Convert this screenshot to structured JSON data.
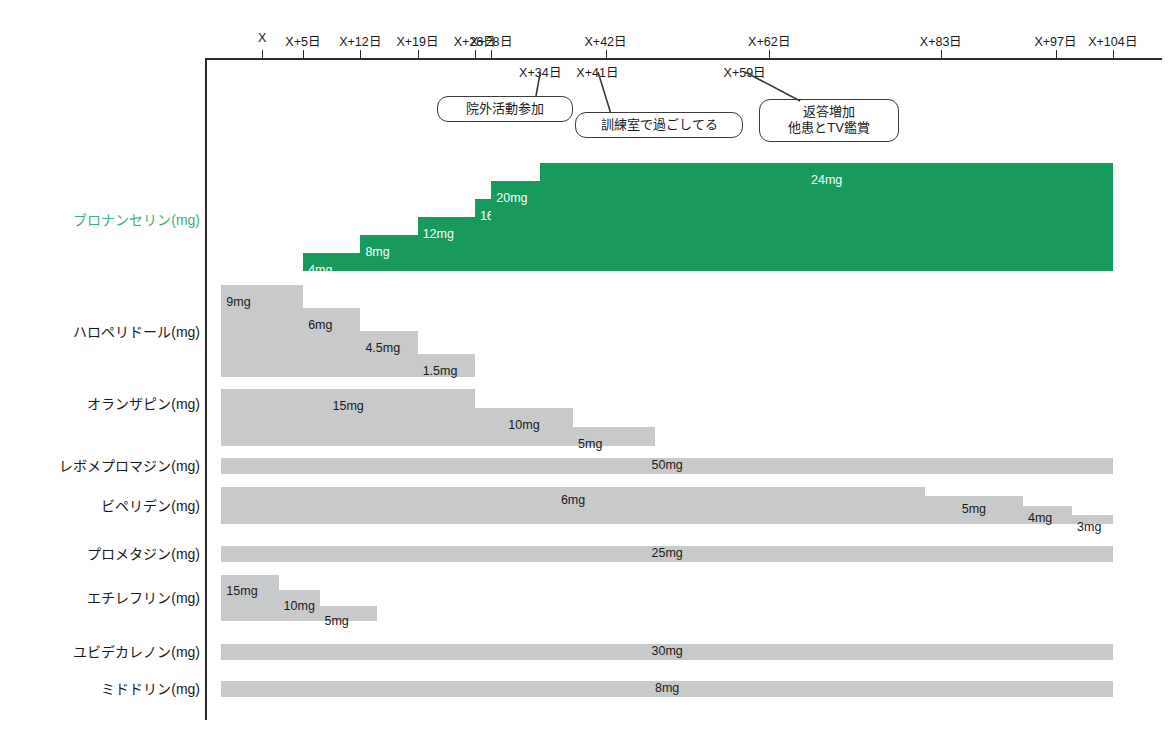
{
  "chart_data": {
    "type": "bar",
    "subtype": "horizontal-timeline-dose-titration",
    "title": "",
    "xlabel": "",
    "ylabel": "",
    "grid": false,
    "legend": "none",
    "axis": {
      "line_color": "#2b2b2b",
      "tick_labels": [
        "X",
        "X+5日",
        "X+12日",
        "X+19日",
        "X+26日",
        "X+28日",
        "X+42日",
        "X+62日",
        "X+83日",
        "X+97日",
        "X+104日"
      ],
      "tick_days": [
        0,
        5,
        12,
        19,
        26,
        28,
        42,
        62,
        83,
        97,
        104
      ],
      "sub_tick_labels": [
        "X+34日",
        "X+41日",
        "X+59日"
      ],
      "sub_tick_days": [
        34,
        41,
        59
      ],
      "range_days": [
        -7,
        110
      ]
    },
    "annotations": [
      {
        "id": "outside-activity",
        "text": "院外活動参加",
        "anchor_label": "X+34日",
        "anchor_day": 34
      },
      {
        "id": "training-room",
        "text": "訓練室で過ごしてる",
        "anchor_label": "X+41日",
        "anchor_day": 41
      },
      {
        "id": "more-responses",
        "text_line1": "返答増加",
        "text_line2": "他患とTV鑑賞",
        "anchor_label": "X+59日",
        "anchor_day": 59
      }
    ],
    "colors": {
      "accent_green": "#189a5c",
      "bar_grey": "#c8c9ca",
      "label_green": "#3fae7a",
      "axis": "#2b2b2b"
    },
    "series": [
      {
        "name": "ブロナンセリン(mg)",
        "drug": "ブロナンセリン",
        "unit": "mg",
        "color": "green",
        "highlight": true,
        "segments": [
          {
            "label": "4mg",
            "value": 4,
            "start_day": 5,
            "end_day": 12
          },
          {
            "label": "8mg",
            "value": 8,
            "start_day": 12,
            "end_day": 19
          },
          {
            "label": "12mg",
            "value": 12,
            "start_day": 19,
            "end_day": 26
          },
          {
            "label": "16mg",
            "value": 16,
            "start_day": 26,
            "end_day": 28
          },
          {
            "label": "20mg",
            "value": 20,
            "start_day": 28,
            "end_day": 34
          },
          {
            "label": "24mg",
            "value": 24,
            "start_day": 34,
            "end_day": 104
          }
        ]
      },
      {
        "name": "ハロペリドール(mg)",
        "drug": "ハロペリドール",
        "unit": "mg",
        "color": "grey",
        "highlight": false,
        "segments": [
          {
            "label": "9mg",
            "value": 9,
            "start_day": -5,
            "end_day": 5
          },
          {
            "label": "6mg",
            "value": 6,
            "start_day": 5,
            "end_day": 12
          },
          {
            "label": "4.5mg",
            "value": 4.5,
            "start_day": 12,
            "end_day": 19
          },
          {
            "label": "1.5mg",
            "value": 1.5,
            "start_day": 19,
            "end_day": 26
          }
        ]
      },
      {
        "name": "オランザピン(mg)",
        "drug": "オランザピン",
        "unit": "mg",
        "color": "grey",
        "highlight": false,
        "segments": [
          {
            "label": "15mg",
            "value": 15,
            "start_day": -5,
            "end_day": 26
          },
          {
            "label": "10mg",
            "value": 10,
            "start_day": 26,
            "end_day": 38
          },
          {
            "label": "5mg",
            "value": 5,
            "start_day": 38,
            "end_day": 48
          }
        ]
      },
      {
        "name": "レボメプロマジン(mg)",
        "drug": "レボメプロマジン",
        "unit": "mg",
        "color": "grey",
        "highlight": false,
        "segments": [
          {
            "label": "50mg",
            "value": 50,
            "start_day": -5,
            "end_day": 104
          }
        ]
      },
      {
        "name": "ビペリデン(mg)",
        "drug": "ビペリデン",
        "unit": "mg",
        "color": "grey",
        "highlight": false,
        "segments": [
          {
            "label": "6mg",
            "value": 6,
            "start_day": -5,
            "end_day": 81
          },
          {
            "label": "5mg",
            "value": 5,
            "start_day": 81,
            "end_day": 93
          },
          {
            "label": "4mg",
            "value": 4,
            "start_day": 93,
            "end_day": 99
          },
          {
            "label": "3mg",
            "value": 3,
            "start_day": 99,
            "end_day": 104
          }
        ]
      },
      {
        "name": "プロメタジン(mg)",
        "drug": "プロメタジン",
        "unit": "mg",
        "color": "grey",
        "highlight": false,
        "segments": [
          {
            "label": "25mg",
            "value": 25,
            "start_day": -5,
            "end_day": 104
          }
        ]
      },
      {
        "name": "エチレフリン(mg)",
        "drug": "エチレフリン",
        "unit": "mg",
        "color": "grey",
        "highlight": false,
        "segments": [
          {
            "label": "15mg",
            "value": 15,
            "start_day": -5,
            "end_day": 2
          },
          {
            "label": "10mg",
            "value": 10,
            "start_day": 2,
            "end_day": 7
          },
          {
            "label": "5mg",
            "value": 5,
            "start_day": 7,
            "end_day": 14
          }
        ]
      },
      {
        "name": "ユビデカレノン(mg)",
        "drug": "ユビデカレノン",
        "unit": "mg",
        "color": "grey",
        "highlight": false,
        "segments": [
          {
            "label": "30mg",
            "value": 30,
            "start_day": -5,
            "end_day": 104
          }
        ]
      },
      {
        "name": "ミドドリン(mg)",
        "drug": "ミドドリン",
        "unit": "mg",
        "color": "grey",
        "highlight": false,
        "segments": [
          {
            "label": "8mg",
            "value": 8,
            "start_day": -5,
            "end_day": 104
          }
        ]
      }
    ]
  },
  "layout": {
    "rows": [
      {
        "label_y": 219,
        "band_top": 163,
        "band_height": 108,
        "step_count": 6
      },
      {
        "label_y": 331,
        "band_top": 285,
        "band_height": 92,
        "step_count": 4
      },
      {
        "label_y": 403,
        "band_top": 389,
        "band_height": 57,
        "step_count": 3
      },
      {
        "label_y": 465,
        "band_top": 458,
        "band_height": 16,
        "step_count": 1
      },
      {
        "label_y": 505,
        "band_top": 487,
        "band_height": 37,
        "step_count": 4
      },
      {
        "label_y": 553,
        "band_top": 546,
        "band_height": 16,
        "step_count": 1
      },
      {
        "label_y": 597,
        "band_top": 575,
        "band_height": 46,
        "step_count": 3
      },
      {
        "label_y": 651,
        "band_top": 644,
        "band_height": 16,
        "step_count": 1
      },
      {
        "label_y": 688,
        "band_top": 681,
        "band_height": 16,
        "step_count": 1
      }
    ],
    "x_axis_px": {
      "left": 205,
      "right": 1162,
      "day_min": -7,
      "day_max": 110
    }
  }
}
